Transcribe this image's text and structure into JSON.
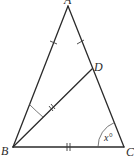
{
  "diagram": {
    "type": "geometry-triangle",
    "points": {
      "A": {
        "label": "A",
        "x": 68,
        "y": 6
      },
      "B": {
        "label": "B",
        "x": 13,
        "y": 147
      },
      "C": {
        "label": "C",
        "x": 124,
        "y": 147
      },
      "D": {
        "label": "D",
        "x": 92,
        "y": 69
      }
    },
    "segments": [
      {
        "from": "A",
        "to": "B",
        "marks": 1
      },
      {
        "from": "A",
        "to": "D",
        "marks": 1
      },
      {
        "from": "D",
        "to": "C",
        "marks": 0
      },
      {
        "from": "B",
        "to": "D",
        "marks": 2
      },
      {
        "from": "B",
        "to": "C",
        "marks": 2
      }
    ],
    "angles": [
      {
        "vertex": "B",
        "between": [
          "A",
          "D"
        ],
        "label": ""
      },
      {
        "vertex": "C",
        "between": [
          "B",
          "D"
        ],
        "label": "x°"
      }
    ],
    "labels": {
      "A": "A",
      "B": "B",
      "C": "C",
      "D": "D",
      "angle_C": "x°"
    },
    "colors": {
      "line": "#2b2b2b",
      "background": "#ffffff"
    }
  }
}
